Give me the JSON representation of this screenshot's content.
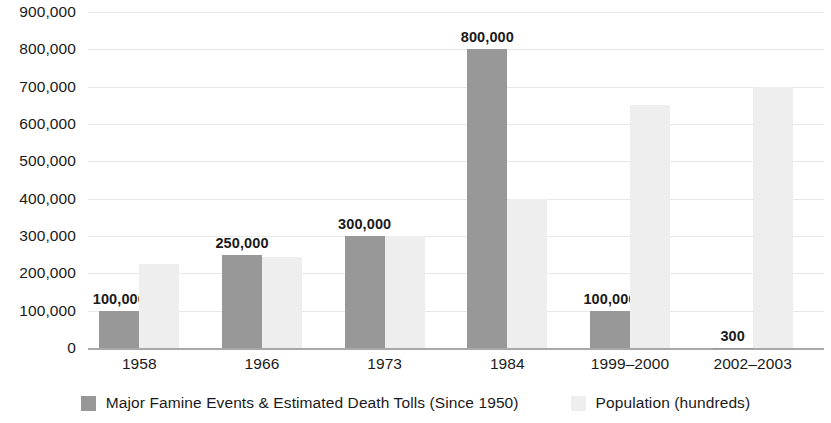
{
  "chart_data": {
    "type": "bar",
    "title": "",
    "subtitle": "",
    "xlabel": "",
    "ylabel": "",
    "categories": [
      "1958",
      "1966",
      "1973",
      "1984",
      "1999–2000",
      "2002–2003"
    ],
    "series": [
      {
        "name": "Major Famine Events & Estimated Death Tolls (Since 1950)",
        "color": "#989898",
        "values": [
          100000,
          250000,
          300000,
          800000,
          100000,
          300
        ],
        "labels": [
          "100,000",
          "250,000",
          "300,000",
          "800,000",
          "100,000",
          "300"
        ]
      },
      {
        "name": "Population (hundreds)",
        "color": "#eeeeee",
        "values": [
          225000,
          245000,
          300000,
          400000,
          650000,
          700000
        ],
        "labels": [
          "",
          "",
          "",
          "",
          "",
          ""
        ]
      }
    ],
    "ylim": [
      0,
      900000
    ],
    "yticks": [
      0,
      100000,
      200000,
      300000,
      400000,
      500000,
      600000,
      700000,
      800000,
      900000
    ],
    "ytick_labels": [
      "0",
      "100,000",
      "200,000",
      "300,000",
      "400,000",
      "500,000",
      "600,000",
      "700,000",
      "800,000",
      "900,000"
    ],
    "grid": true,
    "legend_position": "bottom"
  },
  "legend": {
    "items": [
      {
        "label": "Major Famine Events & Estimated Death Tolls (Since 1950)",
        "swatch": "primary"
      },
      {
        "label": "Population (hundreds)",
        "swatch": "secondary"
      }
    ]
  },
  "colors": {
    "primary_bar": "#989898",
    "secondary_bar": "#eeeeee",
    "gridline": "#e8e8e8",
    "axis": "#a9a9a9",
    "text": "#1a1a1a"
  }
}
